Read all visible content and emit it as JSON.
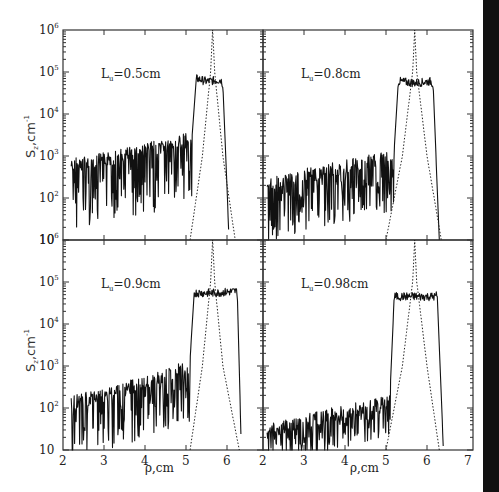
{
  "figure": {
    "ylabel": "S",
    "ylabel_sub": "z",
    "ylabel_unit": ",cm",
    "ylabel_exp": "-1",
    "xlabel": "ρ,cm",
    "y_tick_labels": [
      {
        "base": "10",
        "exp": "6"
      },
      {
        "base": "10",
        "exp": "5"
      },
      {
        "base": "10",
        "exp": "4"
      },
      {
        "base": "10",
        "exp": "3"
      },
      {
        "base": "10",
        "exp": "2"
      },
      {
        "base": "10",
        "exp": ""
      }
    ],
    "x_tick_labels_left": [
      "2",
      "3",
      "4",
      "5",
      "6"
    ],
    "x_tick_labels_right": [
      "2",
      "3",
      "4",
      "5",
      "6",
      "7"
    ]
  },
  "chart_data": [
    {
      "type": "line",
      "panel": "top-left",
      "title": "",
      "annotation": "L_u=0.5cm",
      "annotation_base": "L",
      "annotation_sub": "u",
      "annotation_rest": "=0.5cm",
      "xlabel": "",
      "ylabel": "S_z, cm^-1",
      "xlim": [
        2,
        7
      ],
      "ylim": [
        10,
        1000000
      ],
      "yscale": "log",
      "series": [
        {
          "name": "S_z (solid, oscillating)",
          "style": "solid",
          "x": [
            2.2,
            3.0,
            4.0,
            5.0,
            5.15,
            5.25,
            5.5,
            5.85,
            5.9,
            6.05
          ],
          "y": [
            900,
            1200,
            2000,
            3500,
            3000,
            70000,
            60000,
            65000,
            50000,
            10
          ],
          "oscillation_min_ratio": 0.02
        },
        {
          "name": "resonance profile (dotted)",
          "style": "dotted",
          "x": [
            5.1,
            5.4,
            5.6,
            5.65,
            5.7,
            5.9,
            6.2
          ],
          "y": [
            10,
            1000,
            100000,
            1000000,
            100000,
            1000,
            10
          ]
        }
      ]
    },
    {
      "type": "line",
      "panel": "top-right",
      "annotation": "L_u=0.8cm",
      "annotation_base": "L",
      "annotation_sub": "u",
      "annotation_rest": "=0.8cm",
      "xlim": [
        2,
        7
      ],
      "ylim": [
        10,
        1000000
      ],
      "yscale": "log",
      "series": [
        {
          "name": "S_z (solid, oscillating)",
          "style": "solid",
          "x": [
            2.1,
            3.0,
            4.0,
            5.0,
            5.2,
            5.3,
            5.7,
            6.1,
            6.15,
            6.3
          ],
          "y": [
            300,
            500,
            800,
            1300,
            1400,
            60000,
            55000,
            60000,
            50000,
            10
          ],
          "oscillation_min_ratio": 0.03
        },
        {
          "name": "resonance profile (dotted)",
          "style": "dotted",
          "x": [
            5.0,
            5.4,
            5.65,
            5.7,
            5.75,
            6.0,
            6.35
          ],
          "y": [
            10,
            1000,
            100000,
            1000000,
            100000,
            1000,
            10
          ]
        }
      ]
    },
    {
      "type": "line",
      "panel": "bottom-left",
      "annotation": "L_u=0.9cm",
      "annotation_base": "L",
      "annotation_sub": "u",
      "annotation_rest": "=0.9cm",
      "xlim": [
        2,
        7
      ],
      "ylim": [
        10,
        1000000
      ],
      "yscale": "log",
      "series": [
        {
          "name": "S_z (solid, oscillating)",
          "style": "solid",
          "x": [
            2.2,
            3.0,
            4.0,
            5.0,
            5.1,
            5.2,
            5.7,
            6.2,
            6.25,
            6.35
          ],
          "y": [
            200,
            300,
            600,
            1300,
            1500,
            55000,
            55000,
            60000,
            60000,
            10
          ],
          "oscillation_min_ratio": 0.03
        },
        {
          "name": "resonance profile (dotted)",
          "style": "dotted",
          "x": [
            5.1,
            5.4,
            5.6,
            5.65,
            5.7,
            5.9,
            6.3
          ],
          "y": [
            10,
            1000,
            100000,
            1000000,
            100000,
            1000,
            10
          ]
        }
      ]
    },
    {
      "type": "line",
      "panel": "bottom-right",
      "annotation": "L_u=0.98cm",
      "annotation_base": "L",
      "annotation_sub": "u",
      "annotation_rest": "=0.98cm",
      "xlim": [
        2,
        7
      ],
      "ylim": [
        10,
        1000000
      ],
      "yscale": "log",
      "series": [
        {
          "name": "S_z (solid, oscillating)",
          "style": "solid",
          "x": [
            2.1,
            3.0,
            4.0,
            5.0,
            5.1,
            5.2,
            5.7,
            6.2,
            6.25,
            6.4
          ],
          "y": [
            40,
            70,
            120,
            200,
            250,
            45000,
            45000,
            45000,
            50000,
            10
          ],
          "oscillation_min_ratio": 0.1
        },
        {
          "name": "resonance profile (dotted)",
          "style": "dotted",
          "x": [
            5.0,
            5.4,
            5.65,
            5.7,
            5.75,
            6.0,
            6.3
          ],
          "y": [
            10,
            1000,
            100000,
            1000000,
            100000,
            1000,
            10
          ]
        }
      ]
    }
  ]
}
